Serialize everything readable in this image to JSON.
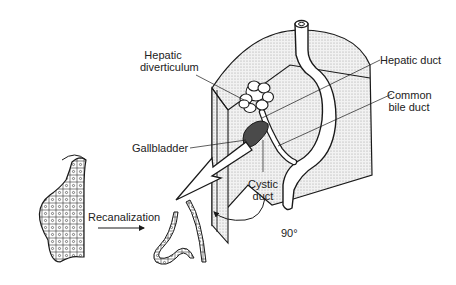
{
  "figure": {
    "type": "anatomical-diagram"
  },
  "labels": {
    "hepatic_diverticulum_line1": "Hepatic",
    "hepatic_diverticulum_line2": "diverticulum",
    "hepatic_duct": "Hepatic duct",
    "common_bile_duct_line1": "Common",
    "common_bile_duct_line2": "bile duct",
    "gallbladder": "Gallbladder",
    "cystic_duct_line1": "Cystic",
    "cystic_duct_line2": "duct",
    "rotation": "90°",
    "recanalization": "Recanalization"
  },
  "colors": {
    "stroke": "#1a1a1a",
    "stipple_fill": "#e4e4e4",
    "gallbladder_fill": "#4a4a4a",
    "background": "#ffffff"
  }
}
